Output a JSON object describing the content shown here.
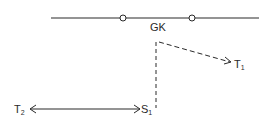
{
  "diagram": {
    "colors": {
      "stroke": "#2a2a2a",
      "background": "#ffffff"
    },
    "top_line": {
      "x1": 51,
      "x2": 259,
      "y": 18,
      "style": "solid"
    },
    "nodes": [
      {
        "id": "circle-left",
        "x": 123,
        "y": 18,
        "r": 3
      },
      {
        "id": "circle-right",
        "x": 192,
        "y": 18,
        "r": 3
      }
    ],
    "labels": {
      "gk": "GK",
      "t1_main": "T",
      "t1_sub": "1",
      "t2_main": "T",
      "t2_sub": "2",
      "s1_main": "S",
      "s1_sub": "1"
    },
    "edges": [
      {
        "id": "vertical-dashed",
        "from": [
          156,
          42
        ],
        "to": [
          156,
          108
        ],
        "style": "dashed"
      },
      {
        "id": "diagonal-dashed-to-t1",
        "from": [
          159,
          42
        ],
        "to": [
          231,
          62
        ],
        "style": "dashed",
        "arrow": "end"
      },
      {
        "id": "double-arrow-t2-s1",
        "from": [
          30,
          109
        ],
        "to": [
          140,
          109
        ],
        "style": "solid",
        "arrow": "both"
      }
    ]
  }
}
